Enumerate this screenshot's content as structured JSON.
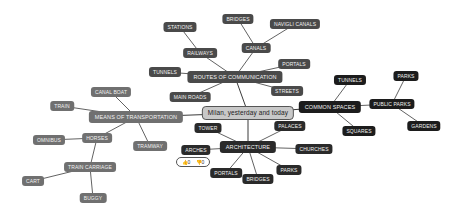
{
  "mindmap": {
    "center": {
      "label": "Milan, yesterday and today",
      "x": 248,
      "y": 113
    },
    "branches": {
      "routes": {
        "label": "ROUTES OF COMMUNICATION",
        "x": 235,
        "y": 77,
        "color": "#4a4a4a",
        "children": {
          "railways": {
            "label": "RAILWAYS",
            "x": 200,
            "y": 53
          },
          "stations": {
            "label": "STATIONS",
            "x": 180,
            "y": 27
          },
          "canals": {
            "label": "CANALS",
            "x": 256,
            "y": 48
          },
          "bridges": {
            "label": "BRIDGES",
            "x": 238,
            "y": 19
          },
          "navigli": {
            "label": "NAVIGLI CANALS",
            "x": 295,
            "y": 24
          },
          "tunnels": {
            "label": "TUNNELS",
            "x": 165,
            "y": 72
          },
          "mainroads": {
            "label": "MAIN ROADS",
            "x": 190,
            "y": 97
          },
          "portals": {
            "label": "PORTALS",
            "x": 294,
            "y": 64
          },
          "streets": {
            "label": "STREETS",
            "x": 287,
            "y": 91
          }
        }
      },
      "common": {
        "label": "COMMON SPACES",
        "x": 330,
        "y": 107,
        "color": "#1c1c1c",
        "children": {
          "tunnels": {
            "label": "TUNNELS",
            "x": 350,
            "y": 80
          },
          "squares": {
            "label": "SQUARES",
            "x": 359,
            "y": 131
          },
          "publicparks": {
            "label": "PUBLIC PARKS",
            "x": 392,
            "y": 104
          },
          "parks": {
            "label": "PARKS",
            "x": 406,
            "y": 76
          },
          "gardens": {
            "label": "GARDENS",
            "x": 424,
            "y": 126
          }
        }
      },
      "transport": {
        "label": "MEANS OF TRANSPORTATION",
        "x": 136,
        "y": 117,
        "color": "#707070",
        "children": {
          "canalboat": {
            "label": "CANAL BOAT",
            "x": 111,
            "y": 92
          },
          "train": {
            "label": "TRAIN",
            "x": 62,
            "y": 106
          },
          "horses": {
            "label": "HORSES",
            "x": 97,
            "y": 138
          },
          "tramway": {
            "label": "TRAMWAY",
            "x": 150,
            "y": 146
          },
          "omnibus": {
            "label": "OMNIBUS",
            "x": 49,
            "y": 140
          },
          "traincarriage": {
            "label": "TRAIN CARRIAGE",
            "x": 90,
            "y": 167
          },
          "cart": {
            "label": "CART",
            "x": 33,
            "y": 181
          },
          "buggy": {
            "label": "BUGGY",
            "x": 93,
            "y": 198
          }
        }
      },
      "arch": {
        "label": "ARCHITECTURE",
        "x": 248,
        "y": 147,
        "color": "#2a2a2a",
        "children": {
          "tower": {
            "label": "TOWER",
            "x": 208,
            "y": 128
          },
          "palaces": {
            "label": "PALACES",
            "x": 290,
            "y": 126
          },
          "churches": {
            "label": "CHURCHES",
            "x": 314,
            "y": 149
          },
          "parks": {
            "label": "PARKS",
            "x": 289,
            "y": 170
          },
          "bridges": {
            "label": "BRIDGES",
            "x": 258,
            "y": 179
          },
          "portals": {
            "label": "PORTALS",
            "x": 226,
            "y": 173
          },
          "arches": {
            "label": "ARCHES",
            "x": 196,
            "y": 150
          }
        }
      }
    },
    "vote_popup": {
      "thumbs_up_icon": "👍",
      "up_count": "0",
      "thumbs_down_icon": "👎",
      "down_count": "0"
    }
  }
}
